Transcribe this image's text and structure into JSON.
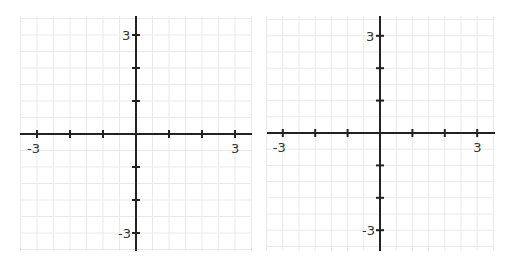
{
  "graphs": [
    {
      "name": "left-coordinate-plane",
      "x_range": [
        -3.5,
        3.5
      ],
      "y_range": [
        -3.5,
        3.5
      ],
      "grid_step": 0.5,
      "tick_step": 1,
      "labels": {
        "x_min": "-3",
        "x_max": "3",
        "y_min": "-3",
        "y_max": "3"
      },
      "box": {
        "left": 20,
        "top": 16,
        "right": 252,
        "bottom": 251
      },
      "origin": {
        "x": 136,
        "y": 134
      },
      "unit": 33
    },
    {
      "name": "right-coordinate-plane",
      "x_range": [
        -3.5,
        3.5
      ],
      "y_range": [
        -3.5,
        3.5
      ],
      "grid_step": 0.5,
      "tick_step": 1,
      "labels": {
        "x_min": "-3",
        "x_max": "3",
        "y_min": "-3",
        "y_max": "3"
      },
      "box": {
        "left": 267,
        "top": 16,
        "right": 495,
        "bottom": 251
      },
      "origin": {
        "x": 380,
        "y": 133
      },
      "unit": 32.4
    }
  ],
  "colors": {
    "grid": "#e9e9e9",
    "axis": "#222222",
    "label": "#333333",
    "background": "#ffffff"
  }
}
